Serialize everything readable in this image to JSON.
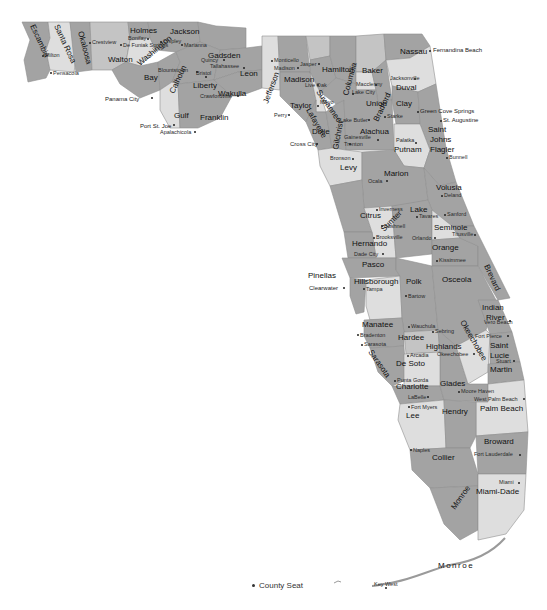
{
  "map": {
    "title": "Florida Counties",
    "legend": {
      "symbol": "dot",
      "label": "County Seat"
    },
    "colors": {
      "dark": "#8c8c8c",
      "mid": "#a3a3a3",
      "light": "#c4c4c4",
      "pale": "#dedede",
      "water": "#ffffff"
    },
    "counties": [
      {
        "name": "Escambia",
        "seat": "Pensacola"
      },
      {
        "name": "Santa Rosa",
        "seat": "Milton"
      },
      {
        "name": "Okaloosa",
        "seat": "Crestview"
      },
      {
        "name": "Walton",
        "seat": "De Funiak Springs"
      },
      {
        "name": "Holmes",
        "seat": "Bonifay"
      },
      {
        "name": "Washington",
        "seat": "Chipley"
      },
      {
        "name": "Jackson",
        "seat": "Marianna"
      },
      {
        "name": "Bay",
        "seat": "Panama City"
      },
      {
        "name": "Calhoun",
        "seat": "Blountstown"
      },
      {
        "name": "Gulf",
        "seat": "Port St. Joe"
      },
      {
        "name": "Gadsden",
        "seat": "Quincy"
      },
      {
        "name": "Liberty",
        "seat": "Bristol"
      },
      {
        "name": "Franklin",
        "seat": "Apalachicola"
      },
      {
        "name": "Leon",
        "seat": "Tallahassee"
      },
      {
        "name": "Wakulla",
        "seat": "Crawfordville"
      },
      {
        "name": "Jefferson",
        "seat": "Monticello"
      },
      {
        "name": "Madison",
        "seat": "Madison"
      },
      {
        "name": "Taylor",
        "seat": "Perry"
      },
      {
        "name": "Hamilton",
        "seat": "Jasper"
      },
      {
        "name": "Suwannee",
        "seat": "Live Oak"
      },
      {
        "name": "Lafayette",
        "seat": "Mayo"
      },
      {
        "name": "Dixie",
        "seat": "Cross City"
      },
      {
        "name": "Columbia",
        "seat": "Lake City"
      },
      {
        "name": "Baker",
        "seat": "Macclenny"
      },
      {
        "name": "Union",
        "seat": "Lake Butler"
      },
      {
        "name": "Bradford",
        "seat": "Starke"
      },
      {
        "name": "Gilchrist",
        "seat": "Trenton"
      },
      {
        "name": "Alachua",
        "seat": "Gainesville"
      },
      {
        "name": "Levy",
        "seat": "Bronson"
      },
      {
        "name": "Nassau",
        "seat": "Fernandina Beach"
      },
      {
        "name": "Duval",
        "seat": "Jacksonville"
      },
      {
        "name": "Clay",
        "seat": "Green Cove Springs"
      },
      {
        "name": "Saint Johns",
        "seat": "St. Augustine"
      },
      {
        "name": "Putnam",
        "seat": "Palatka"
      },
      {
        "name": "Flagler",
        "seat": "Bunnell"
      },
      {
        "name": "Marion",
        "seat": "Ocala"
      },
      {
        "name": "Volusia",
        "seat": "Deland"
      },
      {
        "name": "Citrus",
        "seat": "Inverness"
      },
      {
        "name": "Sumter",
        "seat": "Bushnell"
      },
      {
        "name": "Lake",
        "seat": "Tavares"
      },
      {
        "name": "Seminole",
        "seat": "Sanford"
      },
      {
        "name": "Hernando",
        "seat": "Brooksville"
      },
      {
        "name": "Orange",
        "seat": "Orlando"
      },
      {
        "name": "Brevard",
        "seat": "Titusville"
      },
      {
        "name": "Pasco",
        "seat": "Dade City"
      },
      {
        "name": "Pinellas",
        "seat": "Clearwater"
      },
      {
        "name": "Hillsborough",
        "seat": "Tampa"
      },
      {
        "name": "Polk",
        "seat": "Bartow"
      },
      {
        "name": "Osceola",
        "seat": "Kissimmee"
      },
      {
        "name": "Indian River",
        "seat": "Vero Beach"
      },
      {
        "name": "Manatee",
        "seat": "Bradenton"
      },
      {
        "name": "Hardee",
        "seat": "Wauchula"
      },
      {
        "name": "Highlands",
        "seat": "Sebring"
      },
      {
        "name": "Okeechobee",
        "seat": "Okeechobee"
      },
      {
        "name": "Saint Lucie",
        "seat": "Fort Pierce"
      },
      {
        "name": "Sarasota",
        "seat": "Sarasota"
      },
      {
        "name": "De Soto",
        "seat": "Arcadia"
      },
      {
        "name": "Martin",
        "seat": "Stuart"
      },
      {
        "name": "Charlotte",
        "seat": "Punta Gorda"
      },
      {
        "name": "Glades",
        "seat": "Moore Haven"
      },
      {
        "name": "Palm Beach",
        "seat": "West Palm Beach"
      },
      {
        "name": "Lee",
        "seat": "Fort Myers"
      },
      {
        "name": "Hendry",
        "seat": "LaBelle"
      },
      {
        "name": "Broward",
        "seat": "Fort Lauderdale"
      },
      {
        "name": "Collier",
        "seat": "Naples"
      },
      {
        "name": "Miami-Dade",
        "seat": "Miami"
      },
      {
        "name": "Monroe",
        "seat": "Key West"
      }
    ]
  }
}
